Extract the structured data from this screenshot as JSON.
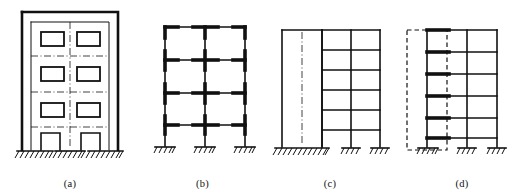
{
  "figure": {
    "background_color": "#ffffff",
    "line_color": "#111111",
    "panel_count": 4
  },
  "panels": [
    {
      "id": "panel-a",
      "caption": "(a)",
      "name": "building-elevation",
      "description": "Three-storey building elevation with exterior wall, window openings and ground-floor door openings",
      "stories": 3,
      "bays": 2,
      "windows_per_story": 2,
      "window_rows": 3,
      "doors": 2,
      "supports": 3,
      "support_type": "hatched-ground",
      "has_centerlines": true,
      "outer_wall": true
    },
    {
      "id": "panel-b",
      "caption": "(b)",
      "name": "rigid-frame-idealization",
      "description": "Idealized four-storey two-bay rigid jointed frame with thickened rigid joint zones",
      "stories": 4,
      "bays": 2,
      "columns": 3,
      "beam_levels": 4,
      "supports": 3,
      "support_type": "fixed-hatched",
      "rigid_joints": true
    },
    {
      "id": "panel-c",
      "caption": "(c)",
      "name": "shear-wall-frame-system",
      "description": "Shear wall with centreline on left connected to a six-storey two-bay frame",
      "stories": 6,
      "bays": 2,
      "columns": 3,
      "beam_levels": 6,
      "supports": 3,
      "wall_present": true,
      "wall_centerline": true,
      "wall_base": "wide-hatched",
      "support_type": "hatched-ground"
    },
    {
      "id": "panel-d",
      "caption": "(d)",
      "name": "wall-frame-interaction-model",
      "description": "Analytical model with dashed wall outline replaced by equivalent column and bold rigid beam stubs",
      "stories": 6,
      "bays": 3,
      "columns": 3,
      "beam_levels": 6,
      "supports": 3,
      "wall_outline": "dashed",
      "rigid_arms": true,
      "rigid_arm_count": 6,
      "support_type": "fixed-hatched"
    }
  ]
}
